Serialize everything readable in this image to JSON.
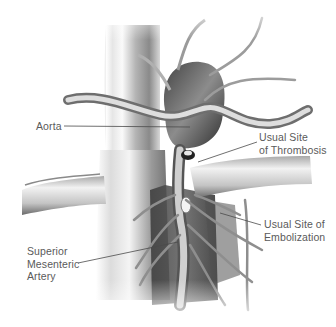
{
  "figure": {
    "background_color": "#ffffff",
    "ink_color": "#5a5a5a",
    "labels": [
      {
        "id": "aorta",
        "lines": [
          "Aorta"
        ],
        "text_x": 36,
        "text_y": 120,
        "leader": {
          "x1": 64,
          "y1": 126,
          "x2": 190,
          "y2": 127
        }
      },
      {
        "id": "thrombosis",
        "lines": [
          "Usual Site",
          "of Thrombosis"
        ],
        "text_x": 259,
        "text_y": 131,
        "leader": {
          "x1": 257,
          "y1": 142,
          "x2": 198,
          "y2": 162
        }
      },
      {
        "id": "embolization",
        "lines": [
          "Usual Site of",
          "Embolization"
        ],
        "text_x": 264,
        "text_y": 218,
        "leader": {
          "x1": 261,
          "y1": 225,
          "x2": 220,
          "y2": 213
        }
      },
      {
        "id": "sma",
        "lines": [
          "Superior",
          "Mesenteric",
          "Artery"
        ],
        "text_x": 27,
        "text_y": 245,
        "leader": {
          "x1": 78,
          "y1": 263,
          "x2": 178,
          "y2": 242
        }
      }
    ]
  }
}
